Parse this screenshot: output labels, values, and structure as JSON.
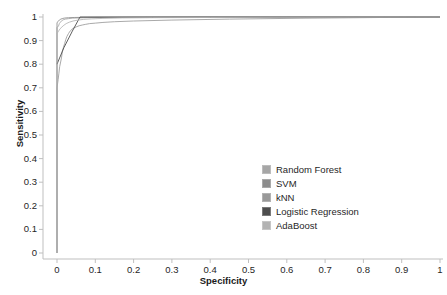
{
  "chart_data": {
    "type": "line",
    "title": "",
    "subtitle": "",
    "xlabel": "Specificity",
    "ylabel": "Sensitivity",
    "xlim": [
      0,
      1
    ],
    "ylim": [
      0,
      1
    ],
    "xticks": [
      "0",
      "0.1",
      "0.2",
      "0.3",
      "0.4",
      "0.5",
      "0.6",
      "0.7",
      "0.8",
      "0.9",
      "1"
    ],
    "yticks": [
      "0",
      "0.1",
      "0.2",
      "0.3",
      "0.4",
      "0.5",
      "0.6",
      "0.7",
      "0.8",
      "0.9",
      "1"
    ],
    "grid": false,
    "legend_position": "center-right",
    "series": [
      {
        "name": "Random Forest",
        "color": "#a6a6a6",
        "points": [
          [
            0,
            0
          ],
          [
            0,
            0.955
          ],
          [
            0.004,
            0.962
          ],
          [
            0.006,
            0.972
          ],
          [
            0.009,
            0.978
          ],
          [
            0.012,
            0.984
          ],
          [
            0.016,
            0.988
          ],
          [
            0.022,
            0.991
          ],
          [
            0.03,
            0.993
          ],
          [
            0.04,
            0.995
          ],
          [
            0.055,
            0.996
          ],
          [
            0.08,
            0.997
          ],
          [
            0.12,
            0.998
          ],
          [
            0.2,
            0.9985
          ],
          [
            0.4,
            0.999
          ],
          [
            0.7,
            0.9995
          ],
          [
            1,
            1
          ]
        ]
      },
      {
        "name": "SVM",
        "color": "#8c8c8c",
        "points": [
          [
            0,
            0
          ],
          [
            0,
            0.975
          ],
          [
            0.003,
            0.982
          ],
          [
            0.006,
            0.987
          ],
          [
            0.01,
            0.991
          ],
          [
            0.015,
            0.994
          ],
          [
            0.02,
            0.9955
          ],
          [
            0.03,
            0.997
          ],
          [
            0.045,
            0.998
          ],
          [
            0.07,
            0.9985
          ],
          [
            0.11,
            0.999
          ],
          [
            0.18,
            0.9993
          ],
          [
            0.35,
            0.9996
          ],
          [
            0.6,
            0.9998
          ],
          [
            1,
            1
          ]
        ]
      },
      {
        "name": "kNN",
        "color": "#999999",
        "points": [
          [
            0,
            0
          ],
          [
            0,
            0.7
          ],
          [
            0.003,
            0.735
          ],
          [
            0.005,
            0.762
          ],
          [
            0.007,
            0.79
          ],
          [
            0.009,
            0.805
          ],
          [
            0.012,
            0.83
          ],
          [
            0.014,
            0.855
          ],
          [
            0.017,
            0.872
          ],
          [
            0.02,
            0.888
          ],
          [
            0.023,
            0.905
          ],
          [
            0.026,
            0.918
          ],
          [
            0.03,
            0.93
          ],
          [
            0.035,
            0.942
          ],
          [
            0.042,
            0.952
          ],
          [
            0.05,
            0.958
          ],
          [
            0.058,
            0.963
          ],
          [
            0.066,
            0.966
          ],
          [
            0.075,
            0.969
          ],
          [
            0.085,
            0.972
          ],
          [
            0.1,
            0.974
          ],
          [
            0.12,
            0.977
          ],
          [
            0.15,
            0.98
          ],
          [
            0.2,
            0.983
          ],
          [
            0.3,
            0.987
          ],
          [
            0.45,
            0.991
          ],
          [
            0.65,
            0.995
          ],
          [
            0.85,
            0.998
          ],
          [
            1,
            1
          ]
        ]
      },
      {
        "name": "Logistic Regression",
        "color": "#4d4d4d",
        "points": [
          [
            0,
            0.8
          ],
          [
            0.018,
            0.87
          ],
          [
            0.04,
            0.94
          ],
          [
            0.06,
            1.0
          ],
          [
            1,
            1
          ]
        ]
      },
      {
        "name": "AdaBoost",
        "color": "#b3b3b3",
        "points": [
          [
            0,
            0
          ],
          [
            0,
            0.93
          ],
          [
            0.004,
            0.94
          ],
          [
            0.008,
            0.95
          ],
          [
            0.013,
            0.958
          ],
          [
            0.018,
            0.965
          ],
          [
            0.024,
            0.972
          ],
          [
            0.032,
            0.978
          ],
          [
            0.042,
            0.983
          ],
          [
            0.055,
            0.987
          ],
          [
            0.07,
            0.99
          ],
          [
            0.09,
            0.992
          ],
          [
            0.12,
            0.994
          ],
          [
            0.17,
            0.996
          ],
          [
            0.25,
            0.997
          ],
          [
            0.4,
            0.998
          ],
          [
            0.65,
            0.999
          ],
          [
            1,
            1
          ]
        ]
      }
    ]
  },
  "axes": {
    "x_axis_name": "Specificity",
    "y_axis_name": "Sensitivity",
    "axis_color": "#bfbfbf"
  },
  "legend": {
    "items": [
      {
        "label": "Random Forest",
        "color": "#a6a6a6"
      },
      {
        "label": "SVM",
        "color": "#8c8c8c"
      },
      {
        "label": "kNN",
        "color": "#999999"
      },
      {
        "label": "Logistic Regression",
        "color": "#4d4d4d"
      },
      {
        "label": "AdaBoost",
        "color": "#b3b3b3"
      }
    ]
  }
}
